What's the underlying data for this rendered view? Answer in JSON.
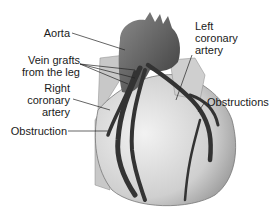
{
  "diagram": {
    "labels": {
      "aorta": "Aorta",
      "vein_grafts_line1": "Vein grafts",
      "vein_grafts_line2": "from the leg",
      "right_coronary_line1": "Right",
      "right_coronary_line2": "coronary",
      "right_coronary_line3": "artery",
      "left_coronary_line1": "Left",
      "left_coronary_line2": "coronary",
      "left_coronary_line3": "artery",
      "obstructions": "Obstructions",
      "obstruction": "Obstruction"
    },
    "colors": {
      "heart_fill": "#d9d9d9",
      "heart_shadow": "#a8a8a8",
      "vessel": "#3a3a3a",
      "aorta": "#555555",
      "background": "#ffffff"
    }
  }
}
